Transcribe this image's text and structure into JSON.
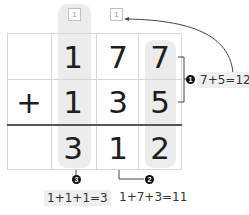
{
  "problem": {
    "operator": "+",
    "top": [
      "",
      "1",
      "7",
      "7"
    ],
    "bottom": [
      "",
      "1",
      "3",
      "5"
    ],
    "result": [
      "",
      "3",
      "1",
      "2"
    ],
    "carries": [
      "1",
      "1"
    ]
  },
  "steps": [
    {
      "badge": "1",
      "text": "7+5=12"
    },
    {
      "badge": "2",
      "text": "1+7+3=11"
    },
    {
      "badge": "3",
      "text": "1+1+1=3"
    }
  ],
  "colors": {
    "highlight": "#ececec",
    "grid": "#d6d6d6",
    "sum_line": "#555555"
  }
}
